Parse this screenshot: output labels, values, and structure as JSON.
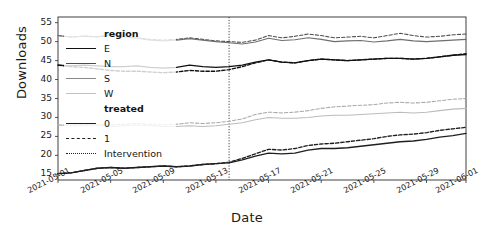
{
  "chart_data": {
    "type": "line",
    "title": "",
    "xlabel": "Date",
    "ylabel": "Downloads",
    "ylim": [
      13.5,
      56.5
    ],
    "yticks": [
      15,
      20,
      25,
      30,
      35,
      40,
      45,
      50,
      55
    ],
    "grid": false,
    "legend_position": "upper-left",
    "x_start": "2021-05-01",
    "x_end": "2021-06-01",
    "xtick_labels": [
      "2021-05-01",
      "2021-05-05",
      "2021-05-09",
      "2021-05-13",
      "2021-05-17",
      "2021-05-21",
      "2021-05-25",
      "2021-05-29",
      "2021-06-01"
    ],
    "xtick_days": [
      0,
      4,
      8,
      12,
      16,
      20,
      24,
      28,
      31
    ],
    "annotations": [
      {
        "name": "Intervention",
        "type": "vline",
        "day": 13,
        "style": "dotted"
      }
    ],
    "legend": {
      "groups": [
        {
          "title": "region",
          "entries": [
            {
              "label": "E",
              "color": "#111111"
            },
            {
              "label": "N",
              "color": "#4d4d4d"
            },
            {
              "label": "S",
              "color": "#8a8a8a"
            },
            {
              "label": "W",
              "color": "#c2c2c2"
            }
          ]
        },
        {
          "title": "treated",
          "entries": [
            {
              "label": "0",
              "dash": "solid"
            },
            {
              "label": "1",
              "dash": "dashed"
            }
          ]
        },
        {
          "title": "",
          "entries": [
            {
              "label": "Intervention",
              "dash": "dotted"
            }
          ]
        }
      ]
    },
    "series": [
      {
        "name": "N treated=1",
        "region": "N",
        "treated": 1,
        "color": "#4d4d4d",
        "dash": "dashed",
        "values": [
          51.6,
          51.2,
          51.5,
          51.3,
          51.8,
          51.4,
          51.0,
          50.6,
          50.4,
          50.6,
          51.0,
          50.6,
          50.2,
          50.0,
          49.8,
          50.4,
          51.6,
          51.0,
          51.4,
          52.0,
          51.6,
          51.0,
          51.2,
          51.4,
          51.0,
          51.6,
          52.2,
          51.6,
          51.2,
          51.4,
          51.8,
          52.0
        ]
      },
      {
        "name": "N treated=0",
        "region": "N",
        "treated": 0,
        "color": "#6e6e6e",
        "dash": "solid",
        "values": [
          51.6,
          51.2,
          51.4,
          51.2,
          51.7,
          51.3,
          50.9,
          50.4,
          50.2,
          50.4,
          50.8,
          50.4,
          50.0,
          49.7,
          49.4,
          49.9,
          50.9,
          50.3,
          50.5,
          51.0,
          50.6,
          50.0,
          50.2,
          50.3,
          49.9,
          50.2,
          50.6,
          50.2,
          50.0,
          50.2,
          50.4,
          50.6
        ]
      },
      {
        "name": "E treated=0",
        "region": "E",
        "treated": 0,
        "color": "#111111",
        "dash": "solid",
        "values": [
          43.8,
          43.6,
          43.8,
          43.6,
          43.4,
          43.4,
          43.6,
          43.2,
          43.0,
          43.2,
          43.8,
          43.4,
          43.2,
          43.4,
          43.8,
          44.6,
          45.2,
          44.6,
          44.4,
          45.0,
          45.4,
          45.2,
          45.0,
          45.2,
          45.4,
          45.6,
          45.6,
          45.4,
          45.6,
          46.0,
          46.4,
          46.6
        ]
      },
      {
        "name": "E treated=1",
        "region": "E",
        "treated": 1,
        "color": "#111111",
        "dash": "dashed",
        "values": [
          43.8,
          43.4,
          43.2,
          42.8,
          42.4,
          42.2,
          42.2,
          42.0,
          41.8,
          42.0,
          42.4,
          42.2,
          42.2,
          42.6,
          43.4,
          44.4,
          45.2,
          44.6,
          44.4,
          45.0,
          45.4,
          45.2,
          45.0,
          45.2,
          45.4,
          45.6,
          45.6,
          45.4,
          45.6,
          46.0,
          46.4,
          46.8
        ]
      },
      {
        "name": "S treated=1",
        "region": "S",
        "treated": 1,
        "color": "#a8a8a8",
        "dash": "dashed",
        "values": [
          28.0,
          28.0,
          28.2,
          28.2,
          28.0,
          28.2,
          28.4,
          28.2,
          28.0,
          28.2,
          28.6,
          28.4,
          28.6,
          29.0,
          29.6,
          30.8,
          31.4,
          31.2,
          31.4,
          31.8,
          32.4,
          32.8,
          33.0,
          33.2,
          33.4,
          33.8,
          34.0,
          33.8,
          34.0,
          34.4,
          34.8,
          35.0
        ]
      },
      {
        "name": "S treated=0",
        "region": "S",
        "treated": 0,
        "color": "#bcbcbc",
        "dash": "solid",
        "values": [
          28.0,
          27.8,
          27.8,
          27.8,
          27.6,
          27.8,
          28.0,
          27.8,
          27.6,
          27.6,
          27.8,
          27.6,
          27.8,
          28.2,
          28.6,
          29.4,
          30.0,
          29.8,
          29.8,
          30.0,
          30.4,
          30.6,
          30.6,
          30.8,
          31.0,
          31.2,
          31.4,
          31.2,
          31.4,
          31.8,
          32.2,
          32.4
        ]
      },
      {
        "name": "W treated=1",
        "region": "W",
        "treated": 1,
        "color": "#1f1f1f",
        "dash": "dashed",
        "values": [
          15.2,
          15.4,
          16.0,
          16.6,
          16.8,
          16.6,
          16.8,
          17.0,
          17.2,
          17.0,
          17.2,
          17.6,
          17.8,
          18.2,
          19.2,
          20.4,
          21.6,
          21.4,
          21.8,
          22.6,
          23.0,
          23.2,
          23.6,
          24.0,
          24.4,
          25.0,
          25.4,
          25.6,
          26.0,
          26.6,
          27.0,
          27.4
        ]
      },
      {
        "name": "W treated=0",
        "region": "W",
        "treated": 0,
        "color": "#1f1f1f",
        "dash": "solid",
        "values": [
          15.2,
          15.4,
          16.0,
          16.6,
          16.8,
          16.6,
          16.8,
          17.0,
          17.2,
          17.0,
          17.2,
          17.6,
          17.8,
          18.0,
          18.8,
          19.8,
          20.6,
          20.4,
          20.6,
          21.4,
          21.8,
          21.8,
          22.0,
          22.4,
          22.8,
          23.2,
          23.6,
          23.8,
          24.2,
          24.8,
          25.2,
          25.8
        ]
      }
    ]
  }
}
